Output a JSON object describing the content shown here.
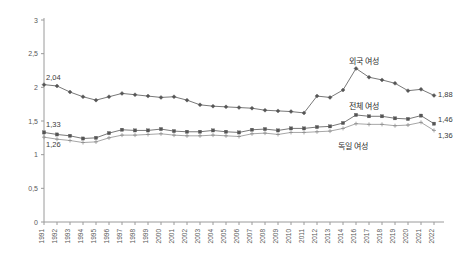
{
  "chart_data": {
    "type": "line",
    "title": "",
    "xlabel": "",
    "ylabel": "",
    "ylim": [
      0,
      3
    ],
    "ytick_labels": [
      "0",
      "0,5",
      "1",
      "1,5",
      "2",
      "2,5",
      "3"
    ],
    "ytick_values": [
      0,
      0.5,
      1,
      1.5,
      2,
      2.5,
      3
    ],
    "grid": false,
    "legend_position": "inline-annotations",
    "decimal_separator": ",",
    "x": [
      1991,
      1992,
      1993,
      1994,
      1995,
      1996,
      1997,
      1998,
      1999,
      2000,
      2001,
      2002,
      2003,
      2004,
      2005,
      2006,
      2007,
      2008,
      2009,
      2010,
      2011,
      2012,
      2013,
      2014,
      2016,
      2017,
      2018,
      2019,
      2020,
      2021,
      2022
    ],
    "categories": [
      "1991",
      "1992",
      "1993",
      "1994",
      "1995",
      "1996",
      "1997",
      "1998",
      "1999",
      "2000",
      "2001",
      "2002",
      "2003",
      "2004",
      "2005",
      "2006",
      "2007",
      "2008",
      "2009",
      "2010",
      "2011",
      "2012",
      "2013",
      "2014",
      "2016",
      "2017",
      "2018",
      "2019",
      "2020",
      "2021",
      "2022"
    ],
    "series": [
      {
        "name": "외국 여성",
        "label": "외국 여성",
        "color": "#555555",
        "marker": "diamond",
        "values": [
          2.04,
          2.02,
          1.93,
          1.86,
          1.81,
          1.86,
          1.91,
          1.89,
          1.87,
          1.85,
          1.86,
          1.81,
          1.74,
          1.72,
          1.71,
          1.7,
          1.69,
          1.66,
          1.65,
          1.64,
          1.62,
          1.87,
          1.85,
          1.96,
          2.28,
          2.15,
          2.11,
          2.06,
          1.95,
          1.97,
          1.88
        ],
        "start_label": "2,04",
        "end_label": "1,88"
      },
      {
        "name": "전체 여성",
        "label": "전체 여성",
        "color": "#555555",
        "marker": "square",
        "values": [
          1.33,
          1.3,
          1.28,
          1.24,
          1.25,
          1.32,
          1.37,
          1.36,
          1.36,
          1.38,
          1.35,
          1.34,
          1.34,
          1.36,
          1.34,
          1.33,
          1.37,
          1.38,
          1.36,
          1.39,
          1.39,
          1.41,
          1.42,
          1.47,
          1.59,
          1.57,
          1.57,
          1.54,
          1.53,
          1.58,
          1.46
        ],
        "start_label": "1,33",
        "end_label": "1,46"
      },
      {
        "name": "독일 여성",
        "label": "독일 여성",
        "color": "#8f8f8f",
        "marker": "plus",
        "values": [
          1.26,
          1.23,
          1.21,
          1.18,
          1.19,
          1.25,
          1.29,
          1.29,
          1.3,
          1.31,
          1.29,
          1.28,
          1.28,
          1.29,
          1.28,
          1.27,
          1.31,
          1.32,
          1.3,
          1.33,
          1.33,
          1.34,
          1.35,
          1.39,
          1.46,
          1.45,
          1.45,
          1.43,
          1.44,
          1.48,
          1.36
        ],
        "start_label": "1,26",
        "end_label": "1,36"
      }
    ]
  },
  "annotations": {
    "foreign_women_label": "외국 여성",
    "all_women_label": "전체 여성",
    "german_women_label": "독일 여성",
    "start_foreign": "2,04",
    "start_all": "1,33",
    "start_german": "1,26",
    "end_foreign": "1,88",
    "end_all": "1,46",
    "end_german": "1,36"
  },
  "colors": {
    "axis": "#9a9a9a",
    "text": "#595959",
    "series_dark": "#555555",
    "series_light": "#8f8f8f",
    "background": "#ffffff"
  }
}
